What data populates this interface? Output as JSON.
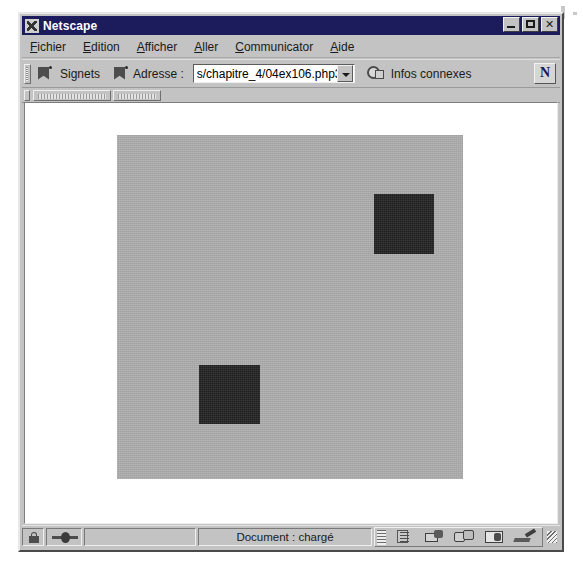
{
  "window": {
    "title": "Netscape",
    "app_icon": "netscape-icon",
    "controls": {
      "minimize": "minimize-button",
      "maximize": "maximize-button",
      "close": "close-button"
    }
  },
  "menubar": {
    "items": [
      {
        "label": "Fichier",
        "mnemonic": "F"
      },
      {
        "label": "Edition",
        "mnemonic": "E"
      },
      {
        "label": "Afficher",
        "mnemonic": "A"
      },
      {
        "label": "Aller",
        "mnemonic": "A"
      },
      {
        "label": "Communicator",
        "mnemonic": "C"
      },
      {
        "label": "Aide",
        "mnemonic": "A"
      }
    ]
  },
  "toolbar": {
    "bookmarks_label": "Signets",
    "bookmarks_icon": "bookmark-icon",
    "address_label": "Adresse :",
    "address_value": "s/chapitre_4/04ex106.php3",
    "address_dropdown_icon": "chevron-down-icon",
    "related_label": "Infos connexes",
    "related_icon": "globe-icon",
    "logo_label": "N",
    "logo_icon": "netscape-n-logo"
  },
  "personal_toolbar": {
    "items": [
      {
        "name": "personal-toolbar-item-1"
      },
      {
        "name": "personal-toolbar-item-2"
      }
    ]
  },
  "page": {
    "canvas": {
      "background_color": "#adadad",
      "width": 346,
      "height": 344,
      "shapes": [
        {
          "name": "square-top-right",
          "color": "#222222",
          "x": 257,
          "y": 59,
          "width": 60,
          "height": 60
        },
        {
          "name": "square-bottom-left",
          "color": "#222222",
          "x": 82,
          "y": 230,
          "width": 61,
          "height": 59
        }
      ]
    }
  },
  "statusbar": {
    "security_icon": "padlock-icon",
    "connection_icon": "network-connection-icon",
    "status_text": "Document : chargé",
    "component_bar": [
      {
        "label": "Navigator",
        "icon": "navigator-icon"
      },
      {
        "label": "Messagerie",
        "icon": "mailbox-icon"
      },
      {
        "label": "Forums",
        "icon": "discussion-groups-icon"
      },
      {
        "label": "Carnet d'adresses",
        "icon": "address-book-icon"
      },
      {
        "label": "Composer",
        "icon": "composer-icon"
      }
    ],
    "resize_grip": "resize-grip"
  },
  "colors": {
    "chrome": "#c3c3c3",
    "titlebar": "#1c1c5c",
    "canvas_gray": "#adadad",
    "square_dark": "#222222"
  }
}
